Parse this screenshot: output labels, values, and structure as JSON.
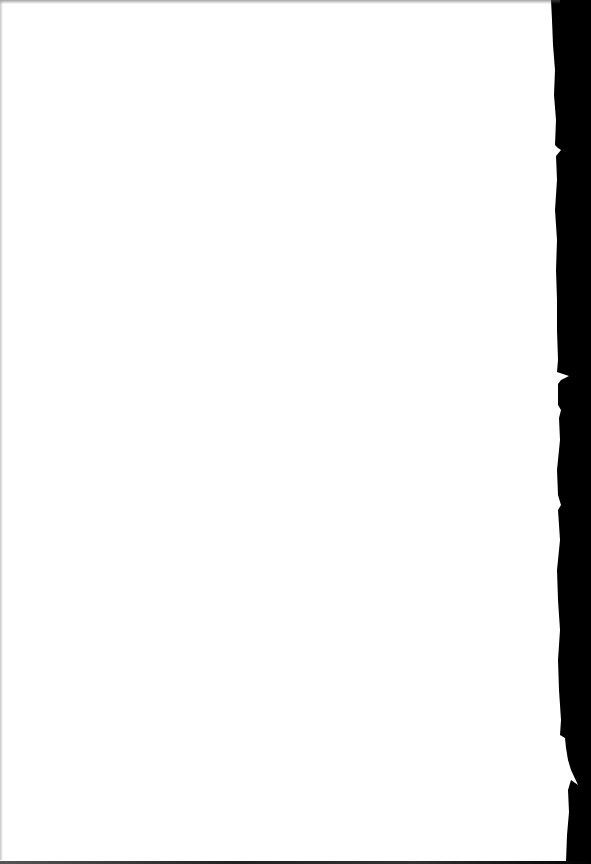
{
  "document": {
    "type": "scanned-page",
    "content": "",
    "page_color": "#ffffff",
    "background_color": "#000000",
    "right_edge": "torn"
  }
}
